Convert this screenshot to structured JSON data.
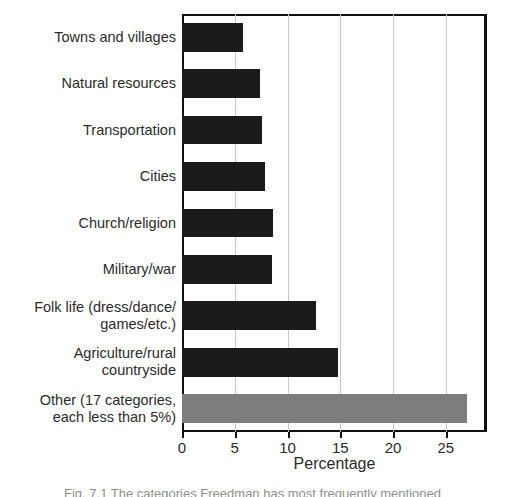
{
  "chart_data": {
    "type": "bar",
    "orientation": "horizontal",
    "title": "",
    "xlabel": "Percentage",
    "ylabel": "",
    "xlim": [
      0,
      28.9
    ],
    "xticks": [
      0,
      5,
      10,
      15,
      20,
      25
    ],
    "xtick_labels": [
      "0",
      "5",
      "10",
      "15",
      "20",
      "25"
    ],
    "grid": "vertical",
    "legend": "none",
    "categories": [
      "Towns and villages",
      "Natural resources",
      "Transportation",
      "Cities",
      "Church/religion",
      "Military/war",
      "Folk life (dress/dance/\ngames/etc.)",
      "Agriculture/rural\ncountryside",
      "Other (17 categories,\neach less than 5%)"
    ],
    "values": [
      5.8,
      7.4,
      7.6,
      7.9,
      8.6,
      8.5,
      12.7,
      14.8,
      27.0
    ],
    "bar_colors": [
      "#1b1b1b",
      "#1b1b1b",
      "#1b1b1b",
      "#1b1b1b",
      "#1b1b1b",
      "#1b1b1b",
      "#1b1b1b",
      "#1b1b1b",
      "#7d7d7d"
    ]
  },
  "axis": {
    "x_title": "Percentage"
  },
  "caption": {
    "text": "Fig. 7.1  The categories Freedman has most frequently mentioned"
  },
  "colors": {
    "bar_dark": "#1b1b1b",
    "bar_gray": "#7d7d7d",
    "gridline": "#c8c8c8",
    "frame": "#111111",
    "text": "#2b2b2b"
  }
}
